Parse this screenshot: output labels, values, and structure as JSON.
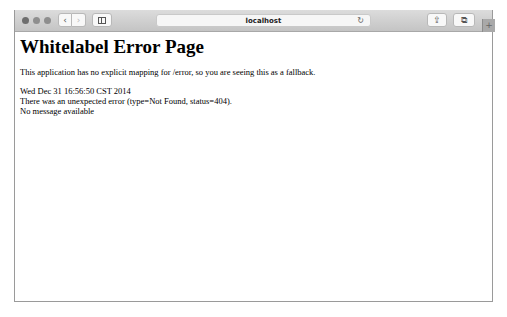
{
  "browser": {
    "address": "localhost",
    "icons": {
      "back": "chevron-left-icon",
      "forward": "chevron-right-icon",
      "sidebar": "sidebar-icon",
      "reload": "reload-icon",
      "share": "share-icon",
      "tabs": "tabs-icon",
      "new_tab": "plus-icon"
    },
    "glyphs": {
      "back": "‹",
      "forward": "›",
      "reload": "↻",
      "share": "⇪",
      "tabs": "⧉",
      "new_tab": "+"
    }
  },
  "page": {
    "title": "Whitelabel Error Page",
    "description": "This application has no explicit mapping for /error, so you are seeing this as a fallback.",
    "timestamp": "Wed Dec 31 16:56:50 CST 2014",
    "error": "There was an unexpected error (type=Not Found, status=404).",
    "message": "No message available"
  }
}
